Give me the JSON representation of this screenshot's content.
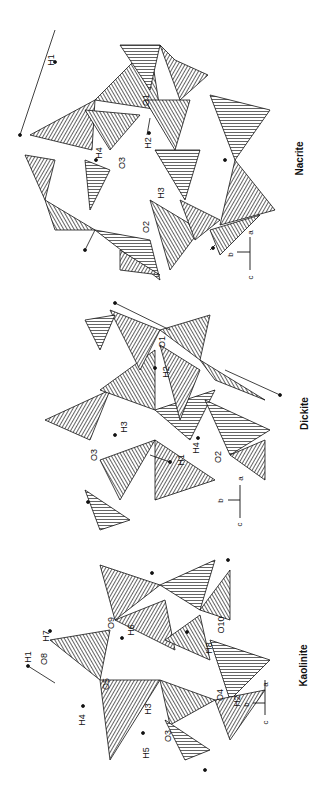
{
  "figure": {
    "orientation": "rotated 90 degrees counterclockwise",
    "panels": [
      {
        "title": "Nacrite",
        "atom_labels": [
          "H1",
          "O1",
          "H2",
          "H4",
          "O3",
          "H3",
          "O2"
        ],
        "axes": {
          "a": "a",
          "b": "b",
          "c": "c"
        }
      },
      {
        "title": "Dickite",
        "atom_labels": [
          "O1",
          "H2",
          "H3",
          "O3",
          "H4",
          "H1",
          "O2"
        ],
        "axes": {
          "a": "a",
          "b": "b",
          "c": "c"
        }
      },
      {
        "title": "Kaolinite",
        "atom_labels": [
          "H1",
          "O8",
          "H7",
          "O9",
          "H6",
          "H4",
          "O5",
          "H3",
          "O3",
          "H5",
          "O10",
          "H8",
          "O4",
          "H2"
        ],
        "axes": {
          "a": "a",
          "b": "b",
          "c": "c"
        }
      }
    ]
  }
}
